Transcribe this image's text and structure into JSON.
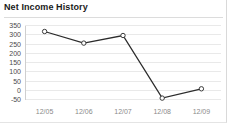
{
  "widget": {
    "title": "Net Income History"
  },
  "chart_data": {
    "type": "line",
    "title": "Net Income History",
    "xlabel": "",
    "ylabel": "",
    "categories": [
      "12/05",
      "12/06",
      "12/07",
      "12/08",
      "12/09"
    ],
    "values": [
      315,
      252,
      293,
      -45,
      5
    ],
    "series": [
      {
        "name": "Net Income",
        "values": [
          315,
          252,
          293,
          -45,
          5
        ]
      }
    ],
    "y_ticks": [
      350,
      300,
      250,
      200,
      150,
      100,
      50,
      0,
      -50
    ],
    "ylim": [
      -50,
      350
    ],
    "grid": true,
    "legend": false,
    "marker": "open-circle",
    "line_color": "#2b2b2b",
    "grid_color": "#e9e9e9",
    "axis_color": "#cfcfcf",
    "tick_label_color": "#4a4a4a",
    "x_tick_label_color": "#8a8a8a"
  }
}
